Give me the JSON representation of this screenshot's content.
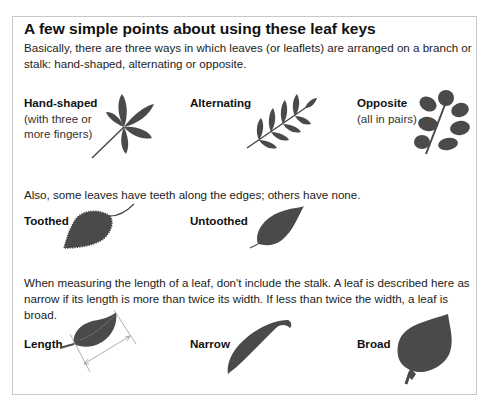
{
  "title": "A few simple points about using these leaf keys",
  "intro": "Basically, there are three ways in which leaves (or leaflets) are arranged on a branch or stalk: hand-shaped, alternating or opposite.",
  "arrangement": {
    "hand_shaped": {
      "label": "Hand-shaped",
      "note": "(with three or more fingers)",
      "icon": "hand-shaped-leaf-icon"
    },
    "alternating": {
      "label": "Alternating",
      "icon": "alternating-leaf-icon"
    },
    "opposite": {
      "label": "Opposite",
      "note": "(all in pairs)",
      "icon": "opposite-leaf-icon"
    }
  },
  "teeth_text": "Also, some leaves have teeth along the edges; others have none.",
  "edges": {
    "toothed": {
      "label": "Toothed",
      "icon": "toothed-leaf-icon"
    },
    "untoothed": {
      "label": "Untoothed",
      "icon": "untoothed-leaf-icon"
    }
  },
  "measure_text": "When measuring the length of a leaf, don't include the stalk. A leaf is described here as narrow if its length is more than twice its width. If less than twice the width, a leaf is broad.",
  "shapes": {
    "length": {
      "label": "Length",
      "icon": "length-measure-leaf-icon"
    },
    "narrow": {
      "label": "Narrow",
      "icon": "narrow-leaf-icon"
    },
    "broad": {
      "label": "Broad",
      "icon": "broad-leaf-icon"
    }
  },
  "colors": {
    "leaf": "#4a4a4a",
    "border": "#c8c8c8",
    "measure_line": "#9a9a9a"
  }
}
